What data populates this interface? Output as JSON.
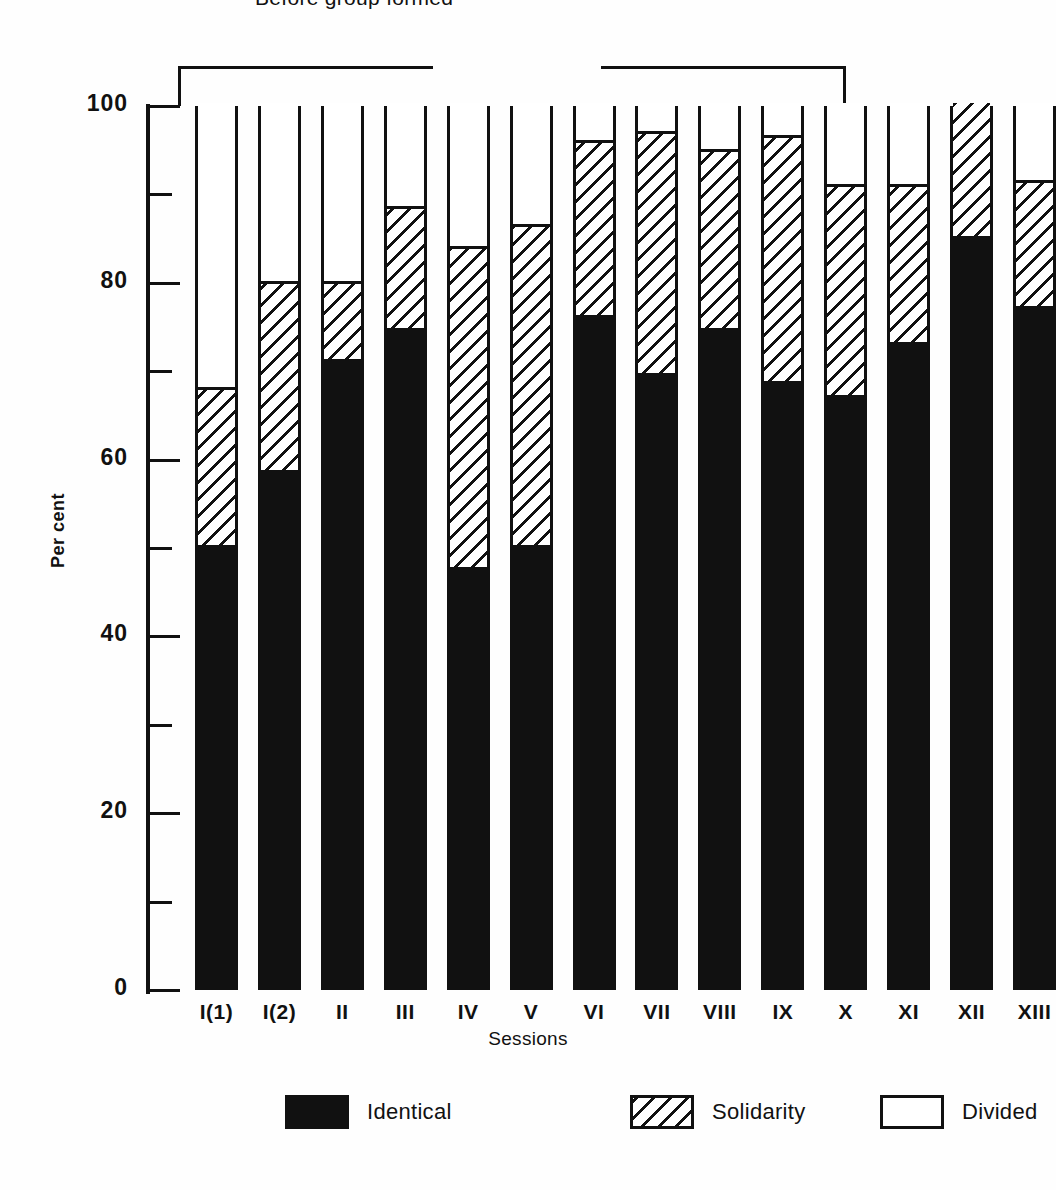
{
  "figure": {
    "annotation": "Before group formed",
    "axis_title_y": "Per cent",
    "axis_title_x": "Sessions"
  },
  "legend": {
    "items": [
      {
        "key": "identical",
        "label": "Identical"
      },
      {
        "key": "solidarity",
        "label": "Solidarity"
      },
      {
        "key": "divided",
        "label": "Divided"
      }
    ]
  },
  "colors": {
    "ink": "#111111",
    "paper": "#ffffff",
    "identical": "#111111",
    "divided": "#ffffff"
  },
  "chart_data": {
    "type": "bar",
    "subtype": "stacked-100-percent",
    "title": "",
    "xlabel": "Sessions",
    "ylabel": "Per cent",
    "ylim": [
      0,
      100
    ],
    "yticks": [
      0,
      20,
      40,
      60,
      80,
      100
    ],
    "yticks_minor": [
      10,
      30,
      50,
      70,
      90
    ],
    "grid": false,
    "legend_position": "bottom",
    "annotations": [
      {
        "text": "Before group formed",
        "spans_categories": [
          "I(1)",
          "X"
        ]
      }
    ],
    "categories": [
      "I(1)",
      "I(2)",
      "II",
      "III",
      "IV",
      "V",
      "VI",
      "VII",
      "VIII",
      "IX",
      "X",
      "XI",
      "XII",
      "XIII"
    ],
    "series": [
      {
        "name": "Identical",
        "values": [
          50,
          58.5,
          71,
          74.5,
          47.5,
          50,
          76,
          69.5,
          74.5,
          68.5,
          67,
          73,
          85,
          77
        ]
      },
      {
        "name": "Solidarity",
        "values": [
          17.5,
          21,
          8.5,
          13.5,
          36,
          36,
          19.5,
          27,
          20,
          27.5,
          23.5,
          17.5,
          15,
          14
        ]
      },
      {
        "name": "Divided",
        "values": [
          32.5,
          20.5,
          20.5,
          12,
          16.5,
          14,
          4.5,
          3.5,
          5.5,
          4,
          9.5,
          9.5,
          0,
          9
        ]
      }
    ],
    "cumulative_tops": {
      "identical": [
        50,
        58.5,
        71,
        74.5,
        47.5,
        50,
        76,
        69.5,
        74.5,
        68.5,
        67,
        73,
        85,
        77
      ],
      "solidarity": [
        67.5,
        79.5,
        79.5,
        88,
        83.5,
        86,
        95.5,
        96.5,
        94.5,
        96,
        90.5,
        90.5,
        100,
        91
      ],
      "divided": [
        100,
        100,
        100,
        100,
        100,
        100,
        100,
        100,
        100,
        100,
        100,
        100,
        100,
        100
      ]
    }
  },
  "yaxis_labels": [
    "100",
    "80",
    "60",
    "40",
    "20",
    "0"
  ]
}
